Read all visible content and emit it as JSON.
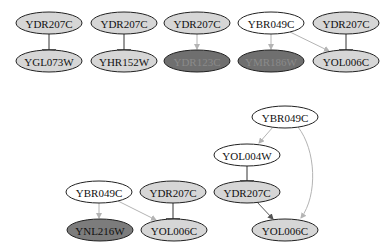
{
  "colors": {
    "light_fill": "#d6d6d6",
    "white_fill": "#ffffff",
    "dark_fill": "#7c7c7c",
    "darker_fill": "#6f6f6f",
    "stroke": "#222222",
    "inhibit_edge": "#333333",
    "activate_edge": "#b4b4b4",
    "text": "#111111",
    "dim_text": "#8a8a8a"
  },
  "graphs": [
    {
      "name": "graph-1",
      "nodes": [
        {
          "id": "n1",
          "label": "YDR207C",
          "cx": 49,
          "cy": 23,
          "fill": "light"
        },
        {
          "id": "n2",
          "label": "YGL073W",
          "cx": 49,
          "cy": 61,
          "fill": "light"
        },
        {
          "id": "n3",
          "label": "YDR207C",
          "cx": 124,
          "cy": 23,
          "fill": "light"
        },
        {
          "id": "n4",
          "label": "YHR152W",
          "cx": 124,
          "cy": 61,
          "fill": "light"
        },
        {
          "id": "n5",
          "label": "YDR207C",
          "cx": 197,
          "cy": 23,
          "fill": "light"
        },
        {
          "id": "n6",
          "label": "YDR123C",
          "cx": 197,
          "cy": 61,
          "fill": "darker"
        },
        {
          "id": "n7",
          "label": "YBR049C",
          "cx": 271,
          "cy": 23,
          "fill": "white"
        },
        {
          "id": "n8",
          "label": "YMR186W",
          "cx": 271,
          "cy": 61,
          "fill": "darker"
        },
        {
          "id": "n9",
          "label": "YDR207C",
          "cx": 346,
          "cy": 23,
          "fill": "light"
        },
        {
          "id": "n10",
          "label": "YOL006C",
          "cx": 346,
          "cy": 61,
          "fill": "light"
        }
      ]
    },
    {
      "name": "graph-2",
      "nodes": [
        {
          "id": "m1",
          "label": "YBR049C",
          "cx": 99,
          "cy": 192,
          "fill": "white"
        },
        {
          "id": "m2",
          "label": "YDR207C",
          "cx": 173,
          "cy": 192,
          "fill": "light"
        },
        {
          "id": "m3",
          "label": "YNL216W",
          "cx": 100,
          "cy": 230,
          "fill": "dark"
        },
        {
          "id": "m4",
          "label": "YOL006C",
          "cx": 174,
          "cy": 230,
          "fill": "light"
        }
      ]
    },
    {
      "name": "graph-3",
      "nodes": [
        {
          "id": "k1",
          "label": "YBR049C",
          "cx": 285,
          "cy": 117,
          "fill": "white"
        },
        {
          "id": "k2",
          "label": "YOL004W",
          "cx": 247,
          "cy": 155,
          "fill": "white"
        },
        {
          "id": "k3",
          "label": "YDR207C",
          "cx": 247,
          "cy": 192,
          "fill": "light"
        },
        {
          "id": "k4",
          "label": "YOL006C",
          "cx": 285,
          "cy": 230,
          "fill": "light"
        }
      ]
    }
  ]
}
